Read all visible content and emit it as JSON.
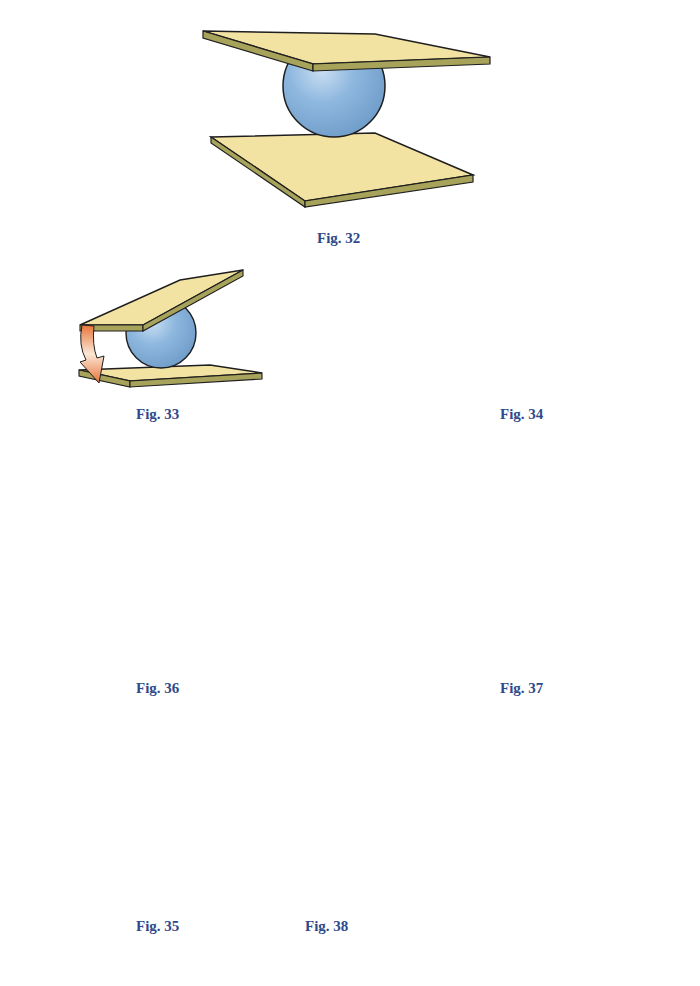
{
  "page": {
    "background": "#ffffff"
  },
  "colors": {
    "plate_top": "#f3e3a3",
    "plate_edge": "#a8a35a",
    "outline": "#1e1e1e",
    "sphere": "#8fb8df",
    "sphere_dark": "#6f9cc9",
    "arrow_orange": "#e8743a",
    "arrow_light": "#fbe7d6",
    "caption": "#2f4a8a"
  },
  "figures": [
    {
      "id": "fig32",
      "caption": "Fig. 32",
      "description": "Sphere between two parallel plates"
    },
    {
      "id": "fig33",
      "caption": "Fig. 33",
      "description": "Top plate tilted; downward curved arrow at left edge"
    },
    {
      "id": "fig34",
      "caption": "Fig. 34",
      "description": "Top plate tilted; upward curved arrow at left edge"
    },
    {
      "id": "fig36",
      "caption": "Fig. 36",
      "description": "Top plate shifted; downward arrow; sphere rolls left"
    },
    {
      "id": "fig37",
      "caption": "Fig. 37",
      "description": "Top plate shifted; upward arrow; sphere rolls right"
    },
    {
      "id": "fig35",
      "caption": "Fig. 35",
      "description": "Top plate rotated; curved arrow at left"
    },
    {
      "id": "fig38",
      "caption": "Fig. 38",
      "description": "Top plate translated diagonally; curved arrow; outlined ghost plate"
    }
  ]
}
